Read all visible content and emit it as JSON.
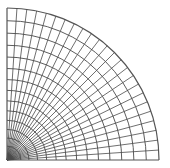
{
  "diagram": {
    "type": "quarter-circle polar mesh",
    "title": "",
    "origin_px": [
      7,
      160
    ],
    "outer_radius_px": 152,
    "radial_divisions": 24,
    "ring_count": 15,
    "ring_grading": "refined toward origin",
    "angle_range_deg": [
      0,
      90
    ],
    "colors": {
      "background": "#ffffff",
      "line": "#4a4a4a",
      "boundary": "#555555",
      "dense_core": "#222222"
    }
  }
}
